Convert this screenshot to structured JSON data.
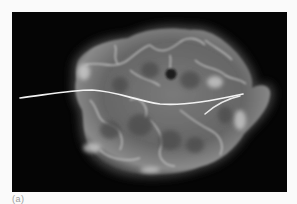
{
  "figure": {
    "type": "radiograph",
    "caption_label": "(a)",
    "colors": {
      "background_page": "#fafafa",
      "panel_background": "#050505",
      "specimen_base": "#6e6e6e",
      "specimen_highlight": "#cfcfcf",
      "wire": "#f2f2f2",
      "hole": "#1c1c1c"
    }
  }
}
